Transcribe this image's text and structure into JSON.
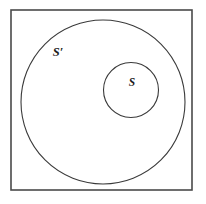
{
  "figure": {
    "type": "euler-set-diagram",
    "background_color": "#ffffff",
    "width": 206,
    "height": 204
  },
  "universe": {
    "name": "universal-set-rectangle",
    "stroke_color": "#4a4a4a",
    "x": 11,
    "y": 10,
    "width": 181,
    "height": 180
  },
  "sets": {
    "outer": {
      "label": "S′",
      "stroke_color": "#3a3a3a",
      "center_x": 103,
      "center_y": 102,
      "radius": 82,
      "label_x": 58,
      "label_y": 56
    },
    "inner": {
      "label": "S",
      "stroke_color": "#3a3a3a",
      "center_x": 131,
      "center_y": 90,
      "radius": 27.5,
      "label_x": 132,
      "label_y": 86
    }
  }
}
